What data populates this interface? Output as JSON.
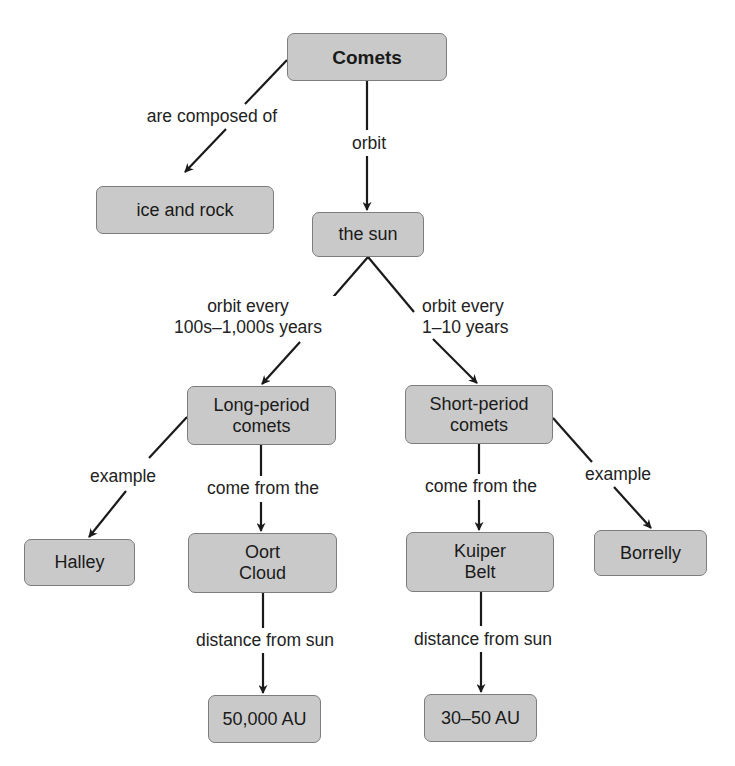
{
  "diagram": {
    "type": "concept-map",
    "title_cut_off": "",
    "colors": {
      "node_fill": "#c9c9c9",
      "node_border": "#7d7d7d",
      "arrow": "#1a1a1a",
      "text": "#1a1a1a",
      "background": "#ffffff"
    },
    "nodes": {
      "comets": "Comets",
      "ice_and_rock": "ice and rock",
      "the_sun": "the sun",
      "long_period": "Long-period\ncomets",
      "short_period": "Short-period\ncomets",
      "halley": "Halley",
      "oort_cloud": "Oort\nCloud",
      "kuiper_belt": "Kuiper\nBelt",
      "borrelly": "Borrelly",
      "dist_oort": "50,000 AU",
      "dist_kuiper": "30–50 AU"
    },
    "links": {
      "composed_of": "are composed of",
      "orbit": "orbit",
      "orbit_long": "orbit every\n100s–1,000s years",
      "orbit_short": "orbit every\n1–10 years",
      "example_long": "example",
      "come_from_long": "come from the",
      "come_from_short": "come from the",
      "example_short": "example",
      "distance_oort": "distance from sun",
      "distance_kuiper": "distance from sun"
    },
    "edges": [
      {
        "from": "Comets",
        "to": "ice and rock",
        "label": "are composed of"
      },
      {
        "from": "Comets",
        "to": "the sun",
        "label": "orbit"
      },
      {
        "from": "the sun",
        "to": "Long-period comets",
        "label": "orbit every 100s–1,000s years"
      },
      {
        "from": "the sun",
        "to": "Short-period comets",
        "label": "orbit every 1–10 years"
      },
      {
        "from": "Long-period comets",
        "to": "Halley",
        "label": "example"
      },
      {
        "from": "Long-period comets",
        "to": "Oort Cloud",
        "label": "come from the"
      },
      {
        "from": "Short-period comets",
        "to": "Kuiper Belt",
        "label": "come from the"
      },
      {
        "from": "Short-period comets",
        "to": "Borrelly",
        "label": "example"
      },
      {
        "from": "Oort Cloud",
        "to": "50,000 AU",
        "label": "distance from sun"
      },
      {
        "from": "Kuiper Belt",
        "to": "30–50 AU",
        "label": "distance from sun"
      }
    ]
  }
}
